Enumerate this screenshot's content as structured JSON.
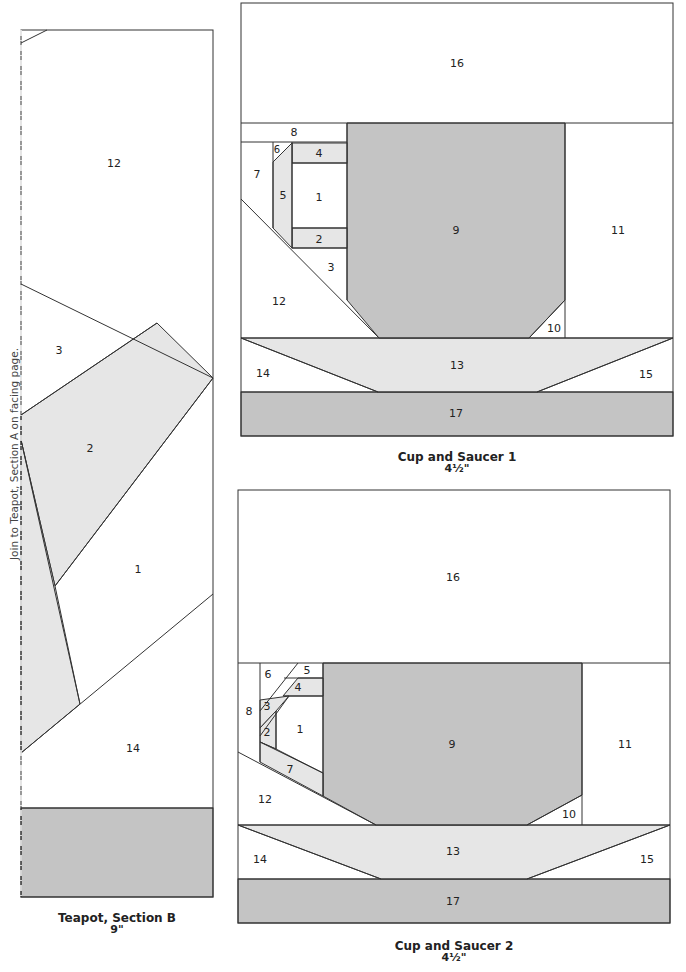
{
  "colors": {
    "white": "#ffffff",
    "light_gray": "#e6e6e6",
    "medium_gray": "#c4c4c4",
    "line": "#333333"
  },
  "teapot": {
    "caption_title": "Teapot, Section B",
    "caption_size": "9\"",
    "side_note": "Join to Teapot, Section A on facing page.",
    "labels": {
      "p12": "12",
      "p3": "3",
      "p2": "2",
      "p1": "1",
      "p14": "14"
    }
  },
  "cup1": {
    "caption_title": "Cup and Saucer 1",
    "caption_size": "4½\"",
    "labels": {
      "p1": "1",
      "p2": "2",
      "p3": "3",
      "p4": "4",
      "p5": "5",
      "p6": "6",
      "p7": "7",
      "p8": "8",
      "p9": "9",
      "p10": "10",
      "p11": "11",
      "p12": "12",
      "p13": "13",
      "p14": "14",
      "p15": "15",
      "p16": "16",
      "p17": "17"
    }
  },
  "cup2": {
    "caption_title": "Cup and Saucer 2",
    "caption_size": "4½\"",
    "labels": {
      "p1": "1",
      "p2": "2",
      "p3": "3",
      "p4": "4",
      "p5": "5",
      "p6": "6",
      "p7": "7",
      "p8": "8",
      "p9": "9",
      "p10": "10",
      "p11": "11",
      "p12": "12",
      "p13": "13",
      "p14": "14",
      "p15": "15",
      "p16": "16",
      "p17": "17"
    }
  }
}
